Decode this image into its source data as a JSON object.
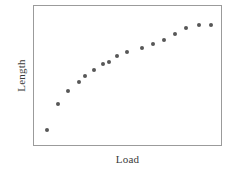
{
  "figure": {
    "width": 240,
    "height": 172,
    "background_color": "#ffffff"
  },
  "axes": {
    "frame_color": "#9b9b9b",
    "x_axis_label": "Load",
    "y_axis_label": "Length"
  },
  "marker": {
    "color": "#575757",
    "shape": "circle",
    "size_px": 4
  },
  "chart_data": {
    "type": "scatter",
    "title": "",
    "xlabel": "Load",
    "ylabel": "Length",
    "xlim": [
      0,
      100
    ],
    "ylim": [
      0,
      100
    ],
    "grid": false,
    "legend": null,
    "tick_labels": {
      "x": [],
      "y": []
    },
    "series": [
      {
        "name": "Length vs Load",
        "color": "#575757",
        "x": [
          7.0,
          13.0,
          18.0,
          24.0,
          27.5,
          32.0,
          37.0,
          40.0,
          44.5,
          49.5,
          57.5,
          63.5,
          69.5,
          75.5,
          81.5,
          88.5,
          94.5
        ],
        "y": [
          11.0,
          29.5,
          39.0,
          45.5,
          49.5,
          54.0,
          58.0,
          59.5,
          64.0,
          67.0,
          70.0,
          72.5,
          75.5,
          80.0,
          84.0,
          86.0,
          86.5
        ],
        "points": [
          {
            "x": 7.0,
            "y": 11.0
          },
          {
            "x": 13.0,
            "y": 29.5
          },
          {
            "x": 18.0,
            "y": 39.0
          },
          {
            "x": 24.0,
            "y": 45.5
          },
          {
            "x": 27.5,
            "y": 49.5
          },
          {
            "x": 32.0,
            "y": 54.0
          },
          {
            "x": 37.0,
            "y": 58.0
          },
          {
            "x": 40.0,
            "y": 59.5
          },
          {
            "x": 44.5,
            "y": 64.0
          },
          {
            "x": 49.5,
            "y": 67.0
          },
          {
            "x": 57.5,
            "y": 70.0
          },
          {
            "x": 63.5,
            "y": 72.5
          },
          {
            "x": 69.5,
            "y": 75.5
          },
          {
            "x": 75.5,
            "y": 80.0
          },
          {
            "x": 81.5,
            "y": 84.0
          },
          {
            "x": 88.5,
            "y": 86.0
          },
          {
            "x": 94.5,
            "y": 86.5
          }
        ]
      }
    ],
    "annotations": []
  }
}
